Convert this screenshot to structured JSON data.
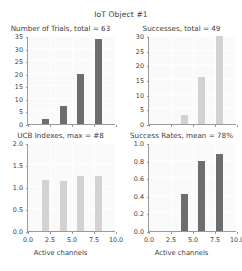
{
  "figure": {
    "suptitle": "IoT Object #1",
    "xlabel": "Active channels",
    "colors": {
      "dark_bar": "#6d6d6d",
      "light_bar": "#d2d2d2",
      "axes_face": "#fafafa",
      "grid": "#ffffff",
      "text": "#3b3b3b",
      "spine": "#9a9a9a"
    }
  },
  "chart_data": [
    {
      "type": "bar",
      "id": "number-of-trials",
      "title": "Number of Trials, total = 63",
      "xlabel": "Active channels",
      "ylabel": "",
      "x": [
        2,
        4,
        6,
        8
      ],
      "values": [
        2,
        7,
        20,
        34
      ],
      "categories": [
        "2",
        "4",
        "6",
        "8"
      ],
      "xlim": [
        0,
        10
      ],
      "ylim": [
        0,
        35
      ],
      "xticks": [
        "0.0",
        "2.5",
        "5.0",
        "7.5",
        "10.0"
      ],
      "xtick_values": [
        0.0,
        2.5,
        5.0,
        7.5,
        10.0
      ],
      "yticks": [
        "0",
        "5",
        "10",
        "15",
        "20",
        "25",
        "30",
        "35"
      ],
      "ytick_values": [
        0,
        5,
        10,
        15,
        20,
        25,
        30,
        35
      ],
      "bar_color": "#6d6d6d",
      "grid": true,
      "legend": "none"
    },
    {
      "type": "bar",
      "id": "successes",
      "title": "Successes, total = 49",
      "xlabel": "Active channels",
      "ylabel": "",
      "x": [
        4,
        6,
        8
      ],
      "values": [
        3,
        16,
        30
      ],
      "categories": [
        "4",
        "6",
        "8"
      ],
      "xlim": [
        0,
        10
      ],
      "ylim": [
        0,
        30
      ],
      "xticks": [
        "0.0",
        "2.5",
        "5.0",
        "7.5",
        "10.0"
      ],
      "xtick_values": [
        0.0,
        2.5,
        5.0,
        7.5,
        10.0
      ],
      "yticks": [
        "0",
        "5",
        "10",
        "15",
        "20",
        "25",
        "30"
      ],
      "ytick_values": [
        0,
        5,
        10,
        15,
        20,
        25,
        30
      ],
      "bar_color": "#d2d2d2",
      "grid": true,
      "legend": "none"
    },
    {
      "type": "bar",
      "id": "ucb-indexes",
      "title": "UCB Indexes, max = #8",
      "xlabel": "Active channels",
      "ylabel": "",
      "x": [
        2,
        4,
        6,
        8
      ],
      "values": [
        1.17,
        1.14,
        1.24,
        1.26
      ],
      "categories": [
        "2",
        "4",
        "6",
        "8"
      ],
      "xlim": [
        0,
        10
      ],
      "ylim": [
        0,
        2.0
      ],
      "xticks": [
        "0.0",
        "2.5",
        "5.0",
        "7.5",
        "10.0"
      ],
      "xtick_values": [
        0.0,
        2.5,
        5.0,
        7.5,
        10.0
      ],
      "yticks": [
        "0.0",
        "0.5",
        "1.0",
        "1.5",
        "2.0"
      ],
      "ytick_values": [
        0.0,
        0.5,
        1.0,
        1.5,
        2.0
      ],
      "bar_color": "#d2d2d2",
      "grid": true,
      "legend": "none"
    },
    {
      "type": "bar",
      "id": "success-rates",
      "title": "Success Rates, mean = 78%",
      "xlabel": "Active channels",
      "ylabel": "",
      "x": [
        4,
        6,
        8
      ],
      "values": [
        0.42,
        0.79,
        0.88
      ],
      "categories": [
        "4",
        "6",
        "8"
      ],
      "xlim": [
        0,
        10
      ],
      "ylim": [
        0,
        1.0
      ],
      "xticks": [
        "0.0",
        "2.5",
        "5.0",
        "7.5",
        "10.0"
      ],
      "xtick_values": [
        0.0,
        2.5,
        5.0,
        7.5,
        10.0
      ],
      "yticks": [
        "0.0",
        "0.2",
        "0.4",
        "0.6",
        "0.8",
        "1.0"
      ],
      "ytick_values": [
        0.0,
        0.2,
        0.4,
        0.6,
        0.8,
        1.0
      ],
      "bar_color": "#6d6d6d",
      "grid": true,
      "legend": "none"
    }
  ]
}
